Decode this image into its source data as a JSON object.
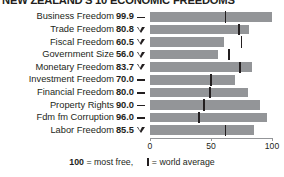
{
  "chart_data": {
    "type": "bar",
    "title": "NEW ZEALAND'S 10 ECONOMIC FREEDOMS",
    "xlabel": "",
    "ylabel": "",
    "xlim": [
      0,
      100
    ],
    "grid": false,
    "legend_position": "bottom",
    "orientation": "horizontal",
    "axis_ticks": [
      "0",
      "50",
      "100"
    ],
    "axis_tick_values": [
      0,
      50,
      100
    ],
    "categories": [
      "Business Freedom",
      "Trade Freedom",
      "Fiscal Freedom",
      "Government Size",
      "Monetary Freedom",
      "Investment Freedom",
      "Financial Freedom",
      "Property Rights",
      "Fdm fm Corruption",
      "Labor Freedom"
    ],
    "values": [
      99.9,
      80.8,
      60.5,
      56.0,
      83.7,
      70.0,
      80.0,
      90.0,
      96.0,
      85.5
    ],
    "value_labels": [
      "99.9",
      "80.8",
      "60.5",
      "56.0",
      "83.7",
      "70.0",
      "80.0",
      "90.0",
      "96.0",
      "85.5"
    ],
    "trends": [
      "flat",
      "down",
      "down",
      "down",
      "down",
      "flat",
      "flat",
      "flat",
      "flat",
      "down"
    ],
    "series": [
      {
        "name": "New Zealand score",
        "values": [
          99.9,
          80.8,
          60.5,
          56.0,
          83.7,
          70.0,
          80.0,
          90.0,
          96.0,
          85.5
        ]
      },
      {
        "name": "world average",
        "values": [
          62.0,
          73.0,
          75.0,
          65.0,
          74.0,
          50.0,
          49.0,
          44.0,
          40.0,
          62.0
        ]
      }
    ],
    "world_average": [
      62.0,
      73.0,
      75.0,
      65.0,
      74.0,
      50.0,
      49.0,
      44.0,
      40.0,
      62.0
    ],
    "colors": {
      "bar": "#939598",
      "world_average_tick": "#231f20",
      "text": "#231f20",
      "background": "#ffffff"
    }
  },
  "footnote": {
    "most_free_value": "100",
    "most_free_text": " = most free,",
    "world_average_text": "= world average"
  }
}
